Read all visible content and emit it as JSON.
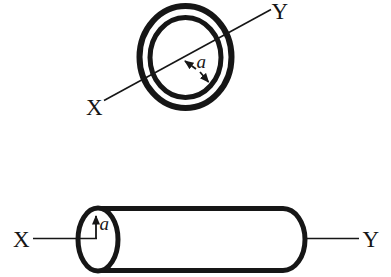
{
  "colors": {
    "ink": "#161616",
    "background": "#ffffff"
  },
  "top_figure": {
    "name": "ring-cross-section",
    "axis_label_left": "X",
    "axis_label_right": "Y",
    "radius_label": "a"
  },
  "bottom_figure": {
    "name": "cylinder",
    "axis_label_left": "X",
    "axis_label_right": "Y",
    "radius_label": "a"
  }
}
